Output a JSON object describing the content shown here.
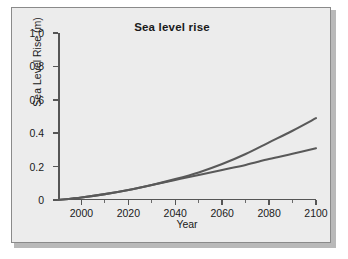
{
  "figure": {
    "background_color": "#ececec",
    "page_background_color": "#ffffff",
    "border_color": "#8a8a8a"
  },
  "chart_data": {
    "type": "line",
    "title": "Sea level rise",
    "xlabel": "Year",
    "ylabel": "Sea Level Rise (m)",
    "xlim": [
      1990,
      2100
    ],
    "ylim": [
      0,
      1.0
    ],
    "grid": false,
    "legend": null,
    "xticks": [
      2000,
      2020,
      2040,
      2060,
      2080,
      2100
    ],
    "xtick_labels": [
      "2000",
      "2020",
      "2040",
      "2060",
      "2080",
      "2100"
    ],
    "xticks_minor": [
      1990,
      2010,
      2030,
      2050,
      2070,
      2090
    ],
    "yticks": [
      0,
      0.2,
      0.4,
      0.6,
      0.8,
      1.0
    ],
    "ytick_labels": [
      "0",
      "0.2",
      "0.4",
      "0.6",
      "0.8",
      "1.0"
    ],
    "line_color": "#595959",
    "x": [
      1990,
      2000,
      2010,
      2020,
      2030,
      2040,
      2050,
      2060,
      2070,
      2080,
      2090,
      2100
    ],
    "series": [
      {
        "name": "Upper projection",
        "values": [
          0.0,
          0.015,
          0.035,
          0.06,
          0.09,
          0.125,
          0.165,
          0.215,
          0.275,
          0.345,
          0.415,
          0.49
        ]
      },
      {
        "name": "Lower projection",
        "values": [
          0.0,
          0.015,
          0.035,
          0.06,
          0.09,
          0.12,
          0.15,
          0.18,
          0.21,
          0.245,
          0.277,
          0.31
        ]
      }
    ]
  }
}
